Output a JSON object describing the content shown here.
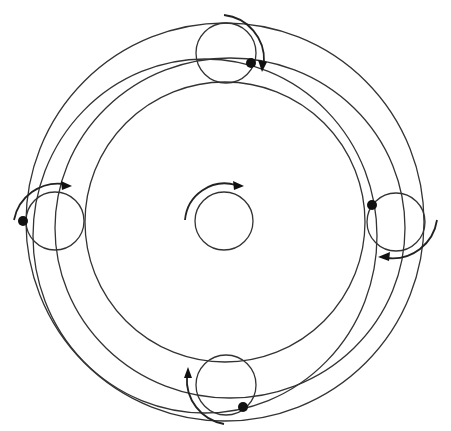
{
  "diagram": {
    "title": "",
    "central_body": {
      "rotation": "clockwise"
    },
    "epicycles": [
      {
        "position": "top",
        "rotation": "clockwise"
      },
      {
        "position": "left",
        "rotation": "clockwise"
      },
      {
        "position": "right",
        "rotation": "clockwise"
      },
      {
        "position": "bottom",
        "rotation": "clockwise"
      }
    ],
    "colors": {
      "stroke": "#333333",
      "planet": "#111111",
      "background": "#ffffff"
    }
  }
}
